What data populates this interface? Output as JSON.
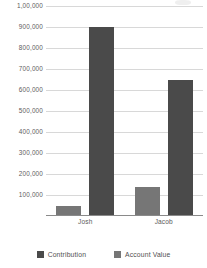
{
  "chart_data": {
    "type": "bar",
    "title": "",
    "xlabel": "",
    "ylabel": "",
    "categories": [
      "Josh",
      "Jacob"
    ],
    "series": [
      {
        "name": "Contribution",
        "color": "#4a4a4a",
        "values": [
          900000,
          650000
        ]
      },
      {
        "name": "Account Value",
        "color": "#767676",
        "values": [
          50000,
          140000
        ]
      }
    ],
    "series_draw_order": [
      "Account Value",
      "Contribution"
    ],
    "ylim": [
      0,
      1000000
    ],
    "ytick_values": [
      100000,
      200000,
      300000,
      400000,
      500000,
      600000,
      700000,
      800000,
      900000,
      1000000
    ],
    "ytick_labels": [
      "100,000",
      "200,000",
      "300,000",
      "400,000",
      "500,000",
      "600,000",
      "700,000",
      "800,000",
      "900,000",
      "1,00,000"
    ],
    "grid": "horizontal",
    "legend_position": "bottom"
  },
  "legend": {
    "items": [
      {
        "label": "Contribution",
        "color": "#4a4a4a"
      },
      {
        "label": "Account Value",
        "color": "#767676"
      }
    ]
  }
}
